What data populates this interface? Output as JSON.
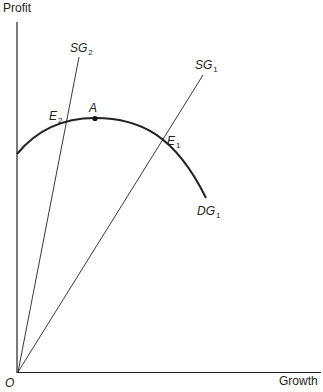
{
  "diagram": {
    "title": "",
    "axes": {
      "y_label": "Profit",
      "x_label": "Growth",
      "origin_label": "O"
    },
    "lines": [
      {
        "id": "SG2",
        "label_main": "SG",
        "label_sub": "2",
        "type": "ray from origin",
        "note": "steeper supply-of-growth line"
      },
      {
        "id": "SG1",
        "label_main": "SG",
        "label_sub": "1",
        "type": "ray from origin",
        "note": "flatter supply-of-growth line"
      }
    ],
    "curve": {
      "id": "DG1",
      "label_main": "DG",
      "label_sub": "1",
      "type": "inverted-U demand-for-growth curve"
    },
    "points": [
      {
        "id": "A",
        "label": "A",
        "note": "maximum profit point on DG1"
      },
      {
        "id": "E2",
        "label_main": "E",
        "label_sub": "2",
        "note": "intersection of SG2 and DG1"
      },
      {
        "id": "E1",
        "label_main": "E",
        "label_sub": "1",
        "note": "intersection of SG1 and DG1"
      }
    ],
    "colors": {
      "lines": "#222222",
      "background": "#ffffff"
    }
  }
}
